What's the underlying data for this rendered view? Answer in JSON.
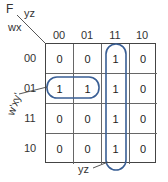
{
  "kmap": {
    "function_label": "F",
    "col_vars": "yz",
    "row_vars": "wx",
    "col_headers": [
      "00",
      "01",
      "11",
      "10"
    ],
    "row_headers": [
      "00",
      "01",
      "11",
      "10"
    ],
    "cells": [
      [
        "0",
        "0",
        "1",
        "0"
      ],
      [
        "1",
        "1",
        "1",
        "0"
      ],
      [
        "0",
        "0",
        "1",
        "0"
      ],
      [
        "0",
        "0",
        "1",
        "0"
      ]
    ],
    "groups": [
      {
        "label": "w'xy'",
        "cells": "row 01, cols 00-01"
      },
      {
        "label": "yz",
        "cells": "col 11, rows 00-10"
      }
    ],
    "group_color": "#3a5f95"
  }
}
